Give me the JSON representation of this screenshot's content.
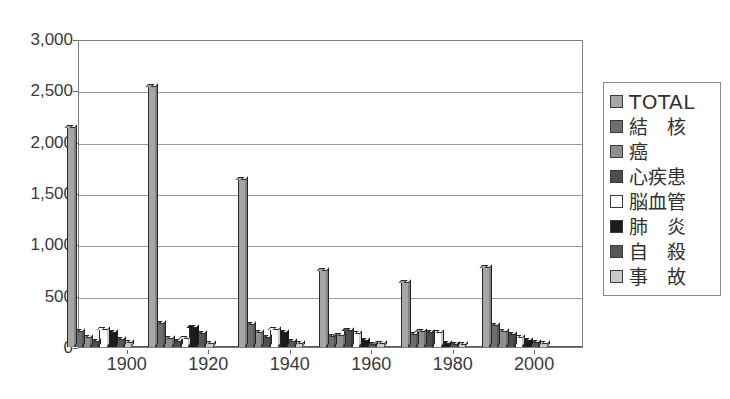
{
  "chart_data": {
    "type": "bar",
    "title": "",
    "xlabel": "",
    "ylabel": "",
    "xlim": [
      1888,
      2012
    ],
    "ylim": [
      0,
      3000
    ],
    "ytick_labels": [
      "3,000",
      "2,500",
      "2,000",
      "1,500",
      "1,000",
      "500",
      "0"
    ],
    "ytick_values": [
      3000,
      2500,
      2000,
      1500,
      1000,
      500,
      0
    ],
    "xtick_labels": [
      "1900",
      "1920",
      "1940",
      "1960",
      "1980",
      "2000"
    ],
    "xtick_values": [
      1900,
      1920,
      1940,
      1960,
      1980,
      2000
    ],
    "grid": "horizontal",
    "legend_position": "right-outside",
    "categories": [
      1893,
      1913,
      1935,
      1955,
      1975,
      1995
    ],
    "series": [
      {
        "name": "TOTAL",
        "color": "#a6a6a6",
        "values": [
          2140,
          2540,
          1640,
          750,
          630,
          780
        ]
      },
      {
        "name": "結　核",
        "color": "#6e6e6e",
        "values": [
          160,
          230,
          220,
          110,
          125,
          215
        ]
      },
      {
        "name": "癌",
        "color": "#8f8f8f",
        "values": [
          95,
          85,
          150,
          120,
          155,
          155
        ]
      },
      {
        "name": "心疾患",
        "color": "#4d4d4d",
        "values": [
          60,
          55,
          95,
          170,
          150,
          130
        ]
      },
      {
        "name": "脳血管",
        "color": "#ffffff",
        "values": [
          180,
          90,
          175,
          135,
          150,
          95
        ]
      },
      {
        "name": "肺　炎",
        "color": "#1c1c1c",
        "values": [
          145,
          195,
          145,
          65,
          35,
          65
        ]
      },
      {
        "name": "自　殺",
        "color": "#575757",
        "values": [
          80,
          140,
          55,
          30,
          25,
          50
        ]
      },
      {
        "name": "事　故",
        "color": "#c9c9c9",
        "values": [
          45,
          40,
          35,
          40,
          30,
          35
        ]
      }
    ]
  },
  "legend": {
    "items": [
      {
        "label": "TOTAL",
        "swatch": "#a6a6a6",
        "latin": true
      },
      {
        "label": "結　核",
        "swatch": "#6e6e6e",
        "latin": false
      },
      {
        "label": "癌",
        "swatch": "#8f8f8f",
        "latin": false
      },
      {
        "label": "心疾患",
        "swatch": "#4d4d4d",
        "latin": false
      },
      {
        "label": "脳血管",
        "swatch": "#ffffff",
        "latin": false
      },
      {
        "label": "肺　炎",
        "swatch": "#1c1c1c",
        "latin": false
      },
      {
        "label": "自　殺",
        "swatch": "#575757",
        "latin": false
      },
      {
        "label": "事　故",
        "swatch": "#c9c9c9",
        "latin": false
      }
    ]
  },
  "strips": {
    "top": "",
    "bottom": ""
  }
}
